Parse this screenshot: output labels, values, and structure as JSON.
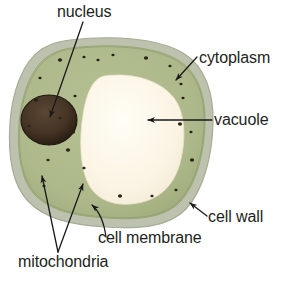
{
  "figure": {
    "background_color": "#ffffff"
  },
  "colors": {
    "cell_wall": "#bcc2ad",
    "cell_wall_edge": "#a8ae98",
    "cytoplasm": "#aeba8c",
    "cytoplasm_dark": "#9aa878",
    "vacuole": "#fbf4e6",
    "nucleus": "#4a3a2a",
    "nucleus_edge": "#241a10",
    "mitochondria": "#2a2218",
    "leader_line": "#1a1a1a",
    "text": "#231f20"
  },
  "labels": {
    "nucleus": "nucleus",
    "cytoplasm": "cytoplasm",
    "vacuole": "vacuole",
    "cell_wall": "cell wall",
    "cell_membrane": "cell membrane",
    "mitochondria": "mitochondria"
  },
  "structures": [
    {
      "name": "cell-wall",
      "label": "cell wall",
      "kind": "outer-band"
    },
    {
      "name": "cytoplasm",
      "label": "cytoplasm",
      "kind": "region"
    },
    {
      "name": "cell-membrane",
      "label": "cell membrane",
      "kind": "boundary"
    },
    {
      "name": "vacuole",
      "label": "vacuole",
      "kind": "organelle"
    },
    {
      "name": "nucleus",
      "label": "nucleus",
      "kind": "organelle"
    },
    {
      "name": "mitochondria",
      "label": "mitochondria",
      "kind": "organelle-cluster"
    }
  ],
  "mitochondria_points": [
    [
      60,
      60
    ],
    [
      84,
      57
    ],
    [
      113,
      55
    ],
    [
      146,
      58
    ],
    [
      170,
      66
    ],
    [
      40,
      78
    ],
    [
      36,
      100
    ],
    [
      29,
      126
    ],
    [
      75,
      96
    ],
    [
      73,
      132
    ],
    [
      181,
      84
    ],
    [
      183,
      98
    ],
    [
      180,
      124
    ],
    [
      191,
      132
    ],
    [
      48,
      160
    ],
    [
      68,
      150
    ],
    [
      84,
      168
    ],
    [
      44,
      186
    ],
    [
      120,
      196
    ],
    [
      152,
      196
    ],
    [
      176,
      190
    ],
    [
      192,
      160
    ],
    [
      98,
      60
    ],
    [
      60,
      118
    ]
  ]
}
